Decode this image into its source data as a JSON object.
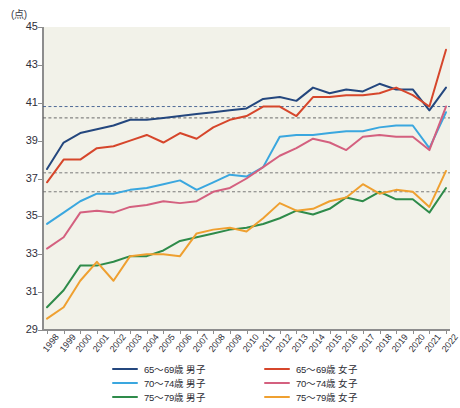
{
  "chart_data": {
    "type": "line",
    "title": "",
    "unit_label": "(点)",
    "ylabel": "点",
    "xlabel": "",
    "ylim": [
      29,
      45
    ],
    "ytick_step": 2,
    "ytick_labels": [
      "29",
      "31",
      "33",
      "35",
      "37",
      "39",
      "41",
      "43",
      "45"
    ],
    "grid": false,
    "legend_position": "bottom",
    "x": [
      1998,
      1999,
      2000,
      2001,
      2002,
      2003,
      2004,
      2005,
      2006,
      2007,
      2008,
      2009,
      2010,
      2011,
      2012,
      2013,
      2014,
      2015,
      2016,
      2017,
      2018,
      2019,
      2020,
      2021,
      2022
    ],
    "categories": [
      "1998",
      "1999",
      "2000",
      "2001",
      "2002",
      "2003",
      "2004",
      "2005",
      "2006",
      "2007",
      "2008",
      "2009",
      "2010",
      "2011",
      "2012",
      "2013",
      "2014",
      "2015",
      "2016",
      "2017",
      "2018",
      "2019",
      "2020",
      "2021",
      "2022"
    ],
    "reference_lines": [
      {
        "value": 40.8,
        "style": "dotted",
        "color": "#3c5a8c"
      },
      {
        "value": 40.2,
        "style": "dotted",
        "color": "#5b5b5b"
      },
      {
        "value": 37.3,
        "style": "dotted",
        "color": "#6d6d6d"
      },
      {
        "value": 36.3,
        "style": "dotted",
        "color": "#6d6d6d"
      }
    ],
    "series": [
      {
        "name": "65〜69歳 男子",
        "color": "#24477e",
        "values": [
          37.5,
          38.9,
          39.4,
          39.6,
          39.8,
          40.1,
          40.1,
          40.2,
          40.3,
          40.4,
          40.5,
          40.6,
          40.7,
          41.2,
          41.3,
          41.1,
          41.8,
          41.5,
          41.7,
          41.6,
          42.0,
          41.7,
          41.7,
          40.6,
          41.8
        ]
      },
      {
        "name": "70〜74歳 男子",
        "color": "#3aa7df",
        "values": [
          34.6,
          35.2,
          35.8,
          36.2,
          36.2,
          36.4,
          36.5,
          36.7,
          36.9,
          36.4,
          36.8,
          37.2,
          37.1,
          37.6,
          39.2,
          39.3,
          39.3,
          39.4,
          39.5,
          39.5,
          39.7,
          39.8,
          39.8,
          38.6,
          40.5
        ]
      },
      {
        "name": "75〜79歳 男子",
        "color": "#2e8b4a",
        "values": [
          30.2,
          31.1,
          32.4,
          32.4,
          32.6,
          32.9,
          32.9,
          33.2,
          33.7,
          33.9,
          34.1,
          34.3,
          34.4,
          34.6,
          34.9,
          35.3,
          35.1,
          35.4,
          36.0,
          35.8,
          36.3,
          35.9,
          35.9,
          35.2,
          36.5
        ]
      },
      {
        "name": "65〜69歳 女子",
        "color": "#d6462b",
        "values": [
          36.8,
          38.0,
          38.0,
          38.6,
          38.7,
          39.0,
          39.3,
          38.9,
          39.4,
          39.1,
          39.7,
          40.1,
          40.3,
          40.8,
          40.8,
          40.3,
          41.3,
          41.3,
          41.4,
          41.4,
          41.5,
          41.8,
          41.4,
          40.8,
          43.8
        ]
      },
      {
        "name": "70〜74歳 女子",
        "color": "#d4607f",
        "values": [
          33.3,
          33.9,
          35.2,
          35.3,
          35.2,
          35.5,
          35.6,
          35.8,
          35.7,
          35.8,
          36.3,
          36.5,
          37.0,
          37.6,
          38.2,
          38.6,
          39.1,
          38.9,
          38.5,
          39.2,
          39.3,
          39.2,
          39.2,
          38.5,
          40.8
        ]
      },
      {
        "name": "75〜79歳 女子",
        "color": "#efa030",
        "values": [
          29.6,
          30.2,
          31.6,
          32.6,
          31.6,
          32.9,
          33.0,
          33.0,
          32.9,
          34.1,
          34.3,
          34.4,
          34.2,
          34.9,
          35.7,
          35.3,
          35.4,
          35.8,
          36.0,
          36.7,
          36.2,
          36.4,
          36.3,
          35.5,
          37.4
        ]
      }
    ]
  },
  "legend": {
    "items": [
      {
        "label": "65〜69歳 男子",
        "color": "#24477e"
      },
      {
        "label": "65〜69歳 女子",
        "color": "#d6462b"
      },
      {
        "label": "70〜74歳 男子",
        "color": "#3aa7df"
      },
      {
        "label": "70〜74歳 女子",
        "color": "#d4607f"
      },
      {
        "label": "75〜79歳 男子",
        "color": "#2e8b4a"
      },
      {
        "label": "75〜79歳 女子",
        "color": "#efa030"
      }
    ]
  }
}
